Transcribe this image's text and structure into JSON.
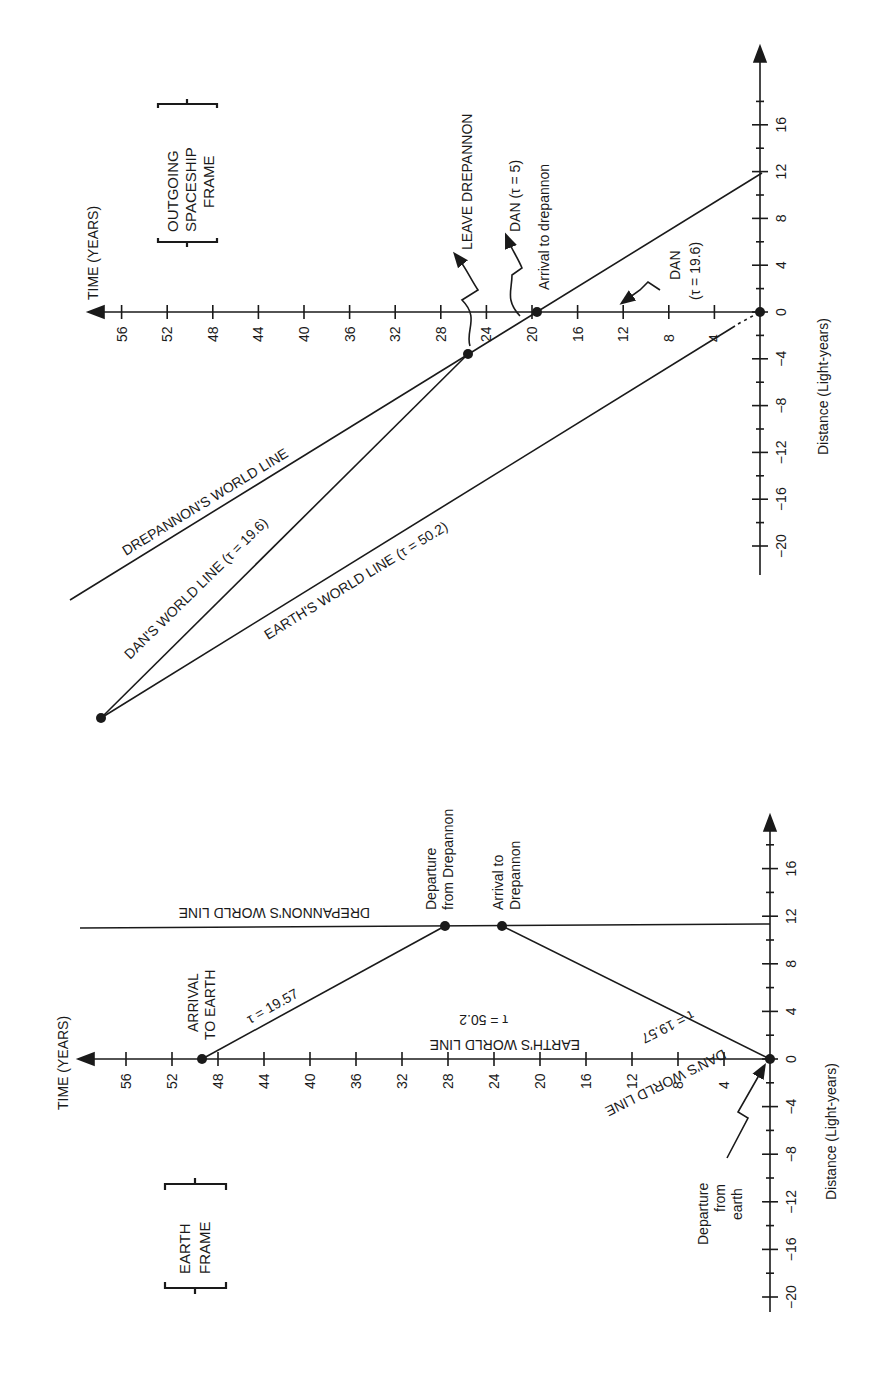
{
  "chart_data": [
    {
      "type": "line",
      "title": "OUTGOING SPACESHIP FRAME",
      "xlabel": "TIME (YEARS)",
      "ylabel": "Distance (Light-years)",
      "time_ticks": [
        4,
        8,
        12,
        16,
        20,
        24,
        28,
        32,
        36,
        40,
        44,
        48,
        52,
        56
      ],
      "distance_ticks": [
        -20,
        -16,
        -12,
        -8,
        -4,
        0,
        4,
        8,
        12,
        16
      ],
      "series": [
        {
          "name": "DREPANNON'S WORLD LINE",
          "points": [
            [
              0,
              11.6
            ],
            [
              60,
              -25
            ]
          ]
        },
        {
          "name": "DAN'S WORLD LINE (τ = 19.6)",
          "points": [
            [
              25.8,
              -3.6
            ],
            [
              57.5,
              -35.5
            ]
          ]
        },
        {
          "name": "EARTH'S WORLD LINE (τ = 50.2)",
          "points": [
            [
              0,
              0
            ],
            [
              57.5,
              -35.5
            ]
          ]
        }
      ],
      "events": [
        {
          "label": "Arrival to drepannon",
          "time": 19.6,
          "distance": 0
        },
        {
          "label": "LEAVE DREPANNON",
          "time": 25.8,
          "distance": -3.6
        },
        {
          "label": "DAN (τ = 5)",
          "time": 22,
          "distance": -1
        },
        {
          "label": "DAN (τ = 19.6)",
          "time": 12,
          "distance": 0
        }
      ]
    },
    {
      "type": "line",
      "title": "EARTH FRAME",
      "xlabel": "TIME (YEARS)",
      "ylabel": "Distance (Light-years)",
      "time_ticks": [
        4,
        8,
        12,
        16,
        20,
        24,
        28,
        32,
        36,
        40,
        44,
        48,
        52,
        56
      ],
      "distance_ticks": [
        -20,
        -16,
        -12,
        -8,
        -4,
        0,
        4,
        8,
        12,
        16
      ],
      "series": [
        {
          "name": "DREPANNON'S WORLD LINE",
          "points": [
            [
              0,
              11.4
            ],
            [
              60,
              11.4
            ]
          ]
        },
        {
          "name": "DAN'S WORLD LINE τ = 19.57 (out)",
          "points": [
            [
              0,
              0
            ],
            [
              23.3,
              11.4
            ]
          ]
        },
        {
          "name": "τ = 19.57 (return)",
          "points": [
            [
              28.4,
              11.4
            ],
            [
              49.4,
              0
            ]
          ]
        },
        {
          "name": "EARTH'S WORLD LINE τ = 50.2",
          "points": [
            [
              0,
              0
            ],
            [
              49.4,
              0
            ]
          ]
        }
      ],
      "events": [
        {
          "label": "Departure from earth",
          "time": 0,
          "distance": 0
        },
        {
          "label": "Arrival to Drepannon",
          "time": 23.3,
          "distance": 11.4
        },
        {
          "label": "Departure from Drepannon",
          "time": 28.4,
          "distance": 11.4
        },
        {
          "label": "ARRIVAL TO EARTH",
          "time": 49.4,
          "distance": 0
        }
      ]
    }
  ],
  "top": {
    "frame_label": [
      "OUTGOING",
      "SPACESHIP",
      "FRAME"
    ],
    "time_axis_label": "TIME (YEARS)",
    "distance_axis_label": "Distance (Light-years)",
    "drepannon_line": "DREPANNON'S WORLD LINE",
    "dan_line": "DAN'S WORLD LINE (τ = 19.6)",
    "earth_line": "EARTH'S WORLD LINE (τ = 50.2)",
    "leave": "LEAVE DREPANNON",
    "dan5": "DAN (τ = 5)",
    "arrival": "Arrival to drepannon",
    "dan196a": "DAN",
    "dan196b": "(τ = 19.6)"
  },
  "bottom": {
    "frame_label": [
      "EARTH",
      "FRAME"
    ],
    "time_axis_label": "TIME (YEARS)",
    "distance_axis_label": "Distance (Light-years)",
    "drepannon_line": "DREPANNON'S WORLD LINE",
    "earth_line": "EARTH'S WORLD LINE",
    "earth_tau": "τ = 50.2",
    "dan_line": "DAN'S WORLD LINE",
    "tau_out": "τ = 19.57",
    "tau_back": "τ = 19.57",
    "arrival_earth": [
      "ARRIVAL",
      "TO EARTH"
    ],
    "departure_drep": [
      "Departure",
      "from Drepannon"
    ],
    "arrival_drep": [
      "Arrival to",
      "Drepannon"
    ],
    "departure_earth": [
      "Departure",
      "from",
      "earth"
    ]
  }
}
